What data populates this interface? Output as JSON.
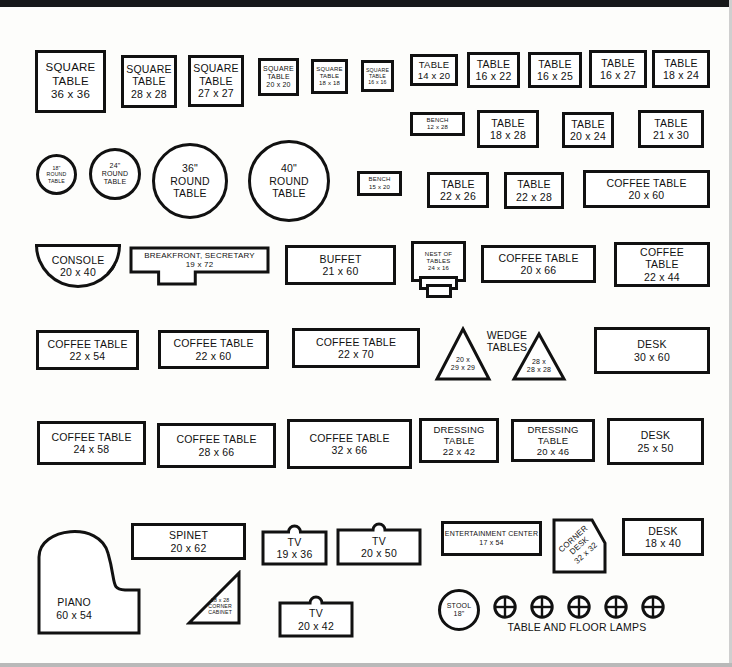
{
  "sheet": {
    "title": "Furniture Template Cutout Sheet",
    "lamps_caption": "TABLE AND FLOOR LAMPS",
    "wedge_caption": "WEDGE\nTABLES"
  },
  "items": [
    {
      "id": "square-table-36",
      "name": "square-table-36x36",
      "label": "SQUARE\nTABLE\n36 x 36",
      "shape": "rect",
      "x": 35,
      "y": 50,
      "w": 71,
      "h": 63,
      "size": "t12"
    },
    {
      "id": "square-table-28",
      "name": "square-table-28x28",
      "label": "SQUARE\nTABLE\n28 x 28",
      "shape": "rect",
      "x": 121,
      "y": 55,
      "w": 56,
      "h": 53,
      "size": "t11"
    },
    {
      "id": "square-table-27",
      "name": "square-table-27x27",
      "label": "SQUARE\nTABLE\n27 x 27",
      "shape": "rect",
      "x": 188,
      "y": 55,
      "w": 56,
      "h": 52,
      "size": "t11"
    },
    {
      "id": "square-table-20",
      "name": "square-table-20x20",
      "label": "SQUARE\nTABLE\n20 x 20",
      "shape": "rect",
      "x": 258,
      "y": 58,
      "w": 41,
      "h": 38,
      "size": "t8"
    },
    {
      "id": "square-table-18",
      "name": "square-table-18x18",
      "label": "SQUARE\nTABLE\n18 x 18",
      "shape": "rect",
      "x": 311,
      "y": 59,
      "w": 37,
      "h": 35,
      "size": "t7"
    },
    {
      "id": "square-table-16",
      "name": "square-table-16x16",
      "label": "SQUARE\nTABLE\n16 x 16",
      "shape": "rect",
      "x": 361,
      "y": 60,
      "w": 33,
      "h": 32,
      "size": "t6"
    },
    {
      "id": "table-14x20",
      "name": "table-14x20",
      "label": "TABLE\n14 x 20",
      "shape": "rect",
      "x": 410,
      "y": 54,
      "w": 48,
      "h": 32,
      "size": "t10"
    },
    {
      "id": "table-16x22",
      "name": "table-16x22",
      "label": "TABLE\n16 x 22",
      "shape": "rect",
      "x": 467,
      "y": 52,
      "w": 53,
      "h": 36,
      "size": "t11"
    },
    {
      "id": "table-16x25",
      "name": "table-16x25",
      "label": "TABLE\n16 x 25",
      "shape": "rect",
      "x": 528,
      "y": 52,
      "w": 54,
      "h": 36,
      "size": "t11"
    },
    {
      "id": "table-16x27",
      "name": "table-16x27",
      "label": "TABLE\n16 x 27",
      "shape": "rect",
      "x": 589,
      "y": 50,
      "w": 58,
      "h": 38,
      "size": "t11"
    },
    {
      "id": "table-18x24",
      "name": "table-18x24",
      "label": "TABLE\n18 x 24",
      "shape": "rect",
      "x": 652,
      "y": 50,
      "w": 58,
      "h": 38,
      "size": "t11"
    },
    {
      "id": "bench-12x28",
      "name": "bench-12x28",
      "label": "BENCH\n12 x 28",
      "shape": "rect",
      "x": 410,
      "y": 112,
      "w": 55,
      "h": 24,
      "size": "t7"
    },
    {
      "id": "table-18x28",
      "name": "table-18x28",
      "label": "TABLE\n18 x 28",
      "shape": "rect",
      "x": 477,
      "y": 110,
      "w": 62,
      "h": 38,
      "size": "t11"
    },
    {
      "id": "table-20x24",
      "name": "table-20x24",
      "label": "TABLE\n20 x 24",
      "shape": "rect",
      "x": 562,
      "y": 112,
      "w": 52,
      "h": 36,
      "size": "t11"
    },
    {
      "id": "table-21x30",
      "name": "table-21x30",
      "label": "TABLE\n21 x 30",
      "shape": "rect",
      "x": 638,
      "y": 110,
      "w": 66,
      "h": 38,
      "size": "t11"
    },
    {
      "id": "round-18",
      "name": "round-table-18",
      "label": "18\"\nROUND\nTABLE",
      "shape": "circle",
      "x": 36,
      "y": 154,
      "w": 41,
      "h": 41,
      "size": "t6"
    },
    {
      "id": "round-24",
      "name": "round-table-24",
      "label": "24\"\nROUND\nTABLE",
      "shape": "circle",
      "x": 89,
      "y": 148,
      "w": 52,
      "h": 52,
      "size": "t8"
    },
    {
      "id": "round-36",
      "name": "round-table-36",
      "label": "36\"\nROUND\nTABLE",
      "shape": "circle",
      "x": 152,
      "y": 143,
      "w": 76,
      "h": 76,
      "size": "t11"
    },
    {
      "id": "round-40",
      "name": "round-table-40",
      "label": "40\"\nROUND\nTABLE",
      "shape": "circle",
      "x": 248,
      "y": 140,
      "w": 82,
      "h": 82,
      "size": "t11"
    },
    {
      "id": "bench-15x20",
      "name": "bench-15x20",
      "label": "BENCH\n15 x 20",
      "shape": "rect",
      "x": 357,
      "y": 171,
      "w": 45,
      "h": 25,
      "size": "t7"
    },
    {
      "id": "table-22x26",
      "name": "table-22x26",
      "label": "TABLE\n22 x 26",
      "shape": "rect",
      "x": 427,
      "y": 172,
      "w": 62,
      "h": 36,
      "size": "t11"
    },
    {
      "id": "table-22x28",
      "name": "table-22x28",
      "label": "TABLE\n22 x 28",
      "shape": "rect",
      "x": 504,
      "y": 172,
      "w": 60,
      "h": 37,
      "size": "t11"
    },
    {
      "id": "coffee-20x60",
      "name": "coffee-table-20x60",
      "label": "COFFEE TABLE\n20 x 60",
      "shape": "rect",
      "x": 583,
      "y": 170,
      "w": 127,
      "h": 38,
      "size": "t11"
    },
    {
      "id": "console-20x40",
      "name": "console-20x40",
      "label": "CONSOLE\n20 x 40",
      "shape": "console",
      "x": 35,
      "y": 244,
      "w": 86,
      "h": 44,
      "size": "t11"
    },
    {
      "id": "breakfront",
      "name": "breakfront-secretary-19x72",
      "label": "BREAKFRONT, SECRETARY\n19 x 72",
      "shape": "breakfront",
      "x": 129,
      "y": 246,
      "w": 141,
      "h": 40,
      "size": "t9"
    },
    {
      "id": "buffet-21x60",
      "name": "buffet-21x60",
      "label": "BUFFET\n21 x 60",
      "shape": "rect",
      "x": 285,
      "y": 245,
      "w": 111,
      "h": 40,
      "size": "t11"
    },
    {
      "id": "nest-24x16",
      "name": "nest-of-tables-24x16",
      "label": "NEST OF\nTABLES\n24 x 16",
      "shape": "nest",
      "x": 411,
      "y": 241,
      "w": 49,
      "h": 35,
      "size": "t7"
    },
    {
      "id": "coffee-20x66",
      "name": "coffee-table-20x66",
      "label": "COFFEE TABLE\n20 x 66",
      "shape": "rect",
      "x": 481,
      "y": 245,
      "w": 115,
      "h": 38,
      "size": "t11"
    },
    {
      "id": "coffee-22x44",
      "name": "coffee-table-22x44",
      "label": "COFFEE\nTABLE\n22 x 44",
      "shape": "rect",
      "x": 614,
      "y": 242,
      "w": 96,
      "h": 45,
      "size": "t11"
    },
    {
      "id": "coffee-22x54",
      "name": "coffee-table-22x54",
      "label": "COFFEE TABLE\n22 x 54",
      "shape": "rect",
      "x": 36,
      "y": 330,
      "w": 103,
      "h": 40,
      "size": "t11"
    },
    {
      "id": "coffee-22x60",
      "name": "coffee-table-22x60",
      "label": "COFFEE TABLE\n22 x 60",
      "shape": "rect",
      "x": 158,
      "y": 330,
      "w": 111,
      "h": 39,
      "size": "t11"
    },
    {
      "id": "coffee-22x70",
      "name": "coffee-table-22x70",
      "label": "COFFEE TABLE\n22 x 70",
      "shape": "rect",
      "x": 292,
      "y": 328,
      "w": 128,
      "h": 40,
      "size": "t11"
    },
    {
      "id": "wedge-20",
      "name": "wedge-table-20x29x29",
      "label": "20 x\n29 x 29",
      "shape": "wedge",
      "x": 434,
      "y": 326,
      "w": 58,
      "h": 56,
      "size": "t8"
    },
    {
      "id": "wedge-28",
      "name": "wedge-table-28x28x28",
      "label": "28 x\n28 x 28",
      "shape": "wedge",
      "x": 511,
      "y": 331,
      "w": 56,
      "h": 51,
      "size": "t8"
    },
    {
      "id": "desk-30x60",
      "name": "desk-30x60",
      "label": "DESK\n30 x 60",
      "shape": "rect",
      "x": 594,
      "y": 327,
      "w": 116,
      "h": 47,
      "size": "t11"
    },
    {
      "id": "coffee-24x58",
      "name": "coffee-table-24x58",
      "label": "COFFEE TABLE\n24 x 58",
      "shape": "rect",
      "x": 37,
      "y": 421,
      "w": 109,
      "h": 44,
      "size": "t11"
    },
    {
      "id": "coffee-28x66",
      "name": "coffee-table-28x66",
      "label": "COFFEE TABLE\n28 x 66",
      "shape": "rect",
      "x": 157,
      "y": 423,
      "w": 119,
      "h": 45,
      "size": "t11"
    },
    {
      "id": "coffee-32x66",
      "name": "coffee-table-32x66",
      "label": "COFFEE TABLE\n32 x 66",
      "shape": "rect",
      "x": 287,
      "y": 419,
      "w": 125,
      "h": 50,
      "size": "t11"
    },
    {
      "id": "dressing-22x42",
      "name": "dressing-table-22x42",
      "label": "DRESSING\nTABLE\n22 x 42",
      "shape": "rect",
      "x": 419,
      "y": 418,
      "w": 80,
      "h": 45,
      "size": "t10"
    },
    {
      "id": "dressing-20x46",
      "name": "dressing-table-20x46",
      "label": "DRESSING\nTABLE\n20 x 46",
      "shape": "rect",
      "x": 511,
      "y": 419,
      "w": 84,
      "h": 43,
      "size": "t10"
    },
    {
      "id": "desk-25x50",
      "name": "desk-25x50",
      "label": "DESK\n25 x 50",
      "shape": "rect",
      "x": 607,
      "y": 418,
      "w": 97,
      "h": 47,
      "size": "t11"
    },
    {
      "id": "piano-60x54",
      "name": "piano-60x54",
      "label": "PIANO\n60 x 54",
      "shape": "piano",
      "x": 36,
      "y": 518,
      "w": 106,
      "h": 118,
      "size": "t11"
    },
    {
      "id": "spinet-20x62",
      "name": "spinet-20x62",
      "label": "SPINET\n20 x 62",
      "shape": "rect",
      "x": 131,
      "y": 523,
      "w": 115,
      "h": 37,
      "size": "t11"
    },
    {
      "id": "tv-19x36",
      "name": "tv-19x36",
      "label": "TV\n19 x 36",
      "shape": "tv",
      "x": 261,
      "y": 524,
      "w": 67,
      "h": 36,
      "size": "t11"
    },
    {
      "id": "tv-20x50",
      "name": "tv-20x50",
      "label": "TV\n20 x 50",
      "shape": "tv",
      "x": 336,
      "y": 522,
      "w": 86,
      "h": 38,
      "size": "t11"
    },
    {
      "id": "entertainment",
      "name": "entertainment-center-17x54",
      "label": "ENTERTAINMENT CENTER\n17 x 54",
      "shape": "rect",
      "x": 441,
      "y": 521,
      "w": 101,
      "h": 35,
      "size": "t8"
    },
    {
      "id": "corner-desk",
      "name": "corner-desk-32x32",
      "label": "CORNER\nDESK\n32 x 32",
      "shape": "cornerdesk",
      "x": 551,
      "y": 517,
      "w": 57,
      "h": 58,
      "size": "t9"
    },
    {
      "id": "desk-18x40",
      "name": "desk-18x40",
      "label": "DESK\n18 x 40",
      "shape": "rect",
      "x": 622,
      "y": 518,
      "w": 82,
      "h": 38,
      "size": "t11"
    },
    {
      "id": "corner-cabinet",
      "name": "corner-cabinet-28x28",
      "label": "28 x 28\nCORNER\nCABINET",
      "shape": "cornercab",
      "x": 186,
      "y": 570,
      "w": 56,
      "h": 56,
      "size": "t6"
    },
    {
      "id": "tv-20x42",
      "name": "tv-20x42",
      "label": "TV\n20 x 42",
      "shape": "tv",
      "x": 278,
      "y": 595,
      "w": 76,
      "h": 37,
      "size": "t11"
    },
    {
      "id": "stool-18",
      "name": "stool-18",
      "label": "STOOL\n18\"",
      "shape": "circle",
      "x": 438,
      "y": 589,
      "w": 42,
      "h": 42,
      "size": "t8"
    }
  ],
  "lamps": [
    {
      "name": "lamp-1",
      "x": 493,
      "y": 595,
      "d": 24
    },
    {
      "name": "lamp-2",
      "x": 530,
      "y": 595,
      "d": 24
    },
    {
      "name": "lamp-3",
      "x": 567,
      "y": 595,
      "d": 24
    },
    {
      "name": "lamp-4",
      "x": 604,
      "y": 595,
      "d": 24
    },
    {
      "name": "lamp-5",
      "x": 641,
      "y": 595,
      "d": 24
    }
  ],
  "captions": {
    "wedge": {
      "text": "WEDGE\nTABLES",
      "x": 476,
      "y": 329,
      "w": 62
    },
    "lamps": {
      "text": "TABLE AND FLOOR LAMPS",
      "x": 487,
      "y": 621,
      "w": 180
    }
  },
  "colors": {
    "ink": "#111111",
    "paper": "#fdfdfb",
    "top_band": "#17181a"
  }
}
